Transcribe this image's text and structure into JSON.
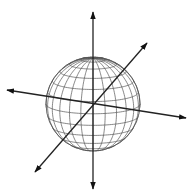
{
  "diagram": {
    "type": "wireframe-sphere-with-axes",
    "background": "#ffffff",
    "line_color": "#222222",
    "grid_color": "#555555",
    "sphere": {
      "cx": 93,
      "cy": 104,
      "r": 47,
      "latitudes": 12,
      "longitudes": 24,
      "tilt_deg": 78
    },
    "axes": [
      {
        "name": "vertical-axis",
        "x1": 93,
        "y1": 189,
        "x2": 93,
        "y2": 12,
        "arrow_both": true
      },
      {
        "name": "horizontal-axis",
        "x1": 7,
        "y1": 90,
        "x2": 186,
        "y2": 118,
        "arrow_both": true
      },
      {
        "name": "diagonal-axis",
        "x1": 35,
        "y1": 172,
        "x2": 147,
        "y2": 43,
        "arrow_both": true
      }
    ]
  }
}
